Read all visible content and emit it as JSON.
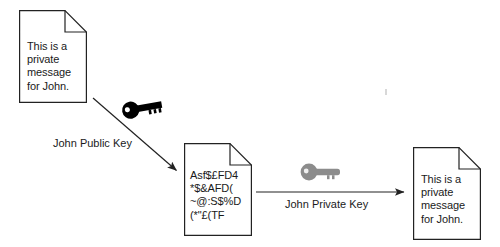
{
  "diagram": {
    "background_color": "#ffffff",
    "stroke_color": "#222222",
    "text_color": "#1a1a1a"
  },
  "documents": [
    {
      "id": "plaintext-source",
      "name": "source-plaintext-document",
      "lines": "This is a\nprivate\nmessage\nfor John.",
      "line_items": [
        "This is a",
        "private",
        "message",
        "for John."
      ]
    },
    {
      "id": "ciphertext",
      "name": "encrypted-document",
      "lines": "Asf$£FD4\n*$&AFD(\n~@:S$%D\n(*\"£(TF",
      "line_items": [
        "Asf$£FD4",
        "*$&AFD(",
        "~@:S$%D",
        "(*\"£(TF"
      ]
    },
    {
      "id": "plaintext-result",
      "name": "decrypted-plaintext-document",
      "lines": "This is a\nprivate\nmessage\nfor John.",
      "line_items": [
        "This is a",
        "private",
        "message",
        "for John."
      ]
    }
  ],
  "keys": [
    {
      "id": "public-key",
      "label": "John Public Key",
      "color": "#000000",
      "icon": "key-icon"
    },
    {
      "id": "private-key",
      "label": "John Private Key",
      "color": "#8c8c8c",
      "icon": "key-icon"
    }
  ],
  "arrows": [
    {
      "id": "encrypt-arrow",
      "name": "encrypt-arrow"
    },
    {
      "id": "decrypt-arrow",
      "name": "decrypt-arrow"
    }
  ]
}
